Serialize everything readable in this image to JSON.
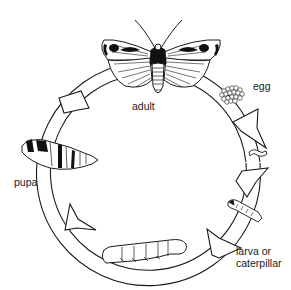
{
  "diagram": {
    "stages": [
      {
        "id": "adult",
        "label": "adult"
      },
      {
        "id": "egg",
        "label": "egg"
      },
      {
        "id": "larva",
        "label_line1": "larva or",
        "label_line2": "caterpillar"
      },
      {
        "id": "pupa",
        "label": "pupa"
      }
    ],
    "flow_direction": "clockwise",
    "colors": {
      "line": "#1a1a1a",
      "fill": "#ffffff",
      "dark": "#111111"
    }
  }
}
